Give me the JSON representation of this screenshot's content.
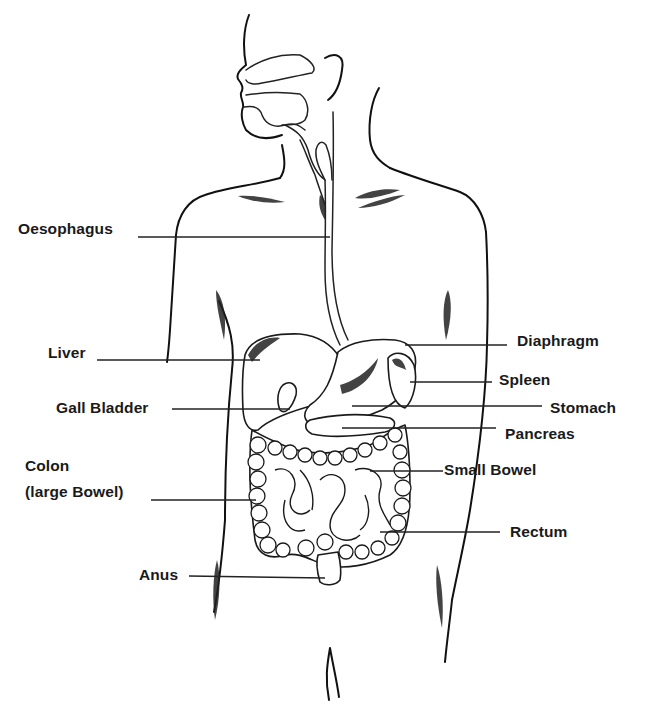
{
  "diagram": {
    "colors": {
      "background": "#ffffff",
      "ink": "#1a1a1a"
    },
    "labels": {
      "oesophagus": "Oesophagus",
      "liver": "Liver",
      "gall_bladder": "Gall Bladder",
      "colon_line1": "Colon",
      "colon_line2": "(large Bowel)",
      "anus": "Anus",
      "diaphragm": "Diaphragm",
      "spleen": "Spleen",
      "stomach": "Stomach",
      "pancreas": "Pancreas",
      "small_bowel": "Small Bowel",
      "rectum": "Rectum"
    }
  }
}
